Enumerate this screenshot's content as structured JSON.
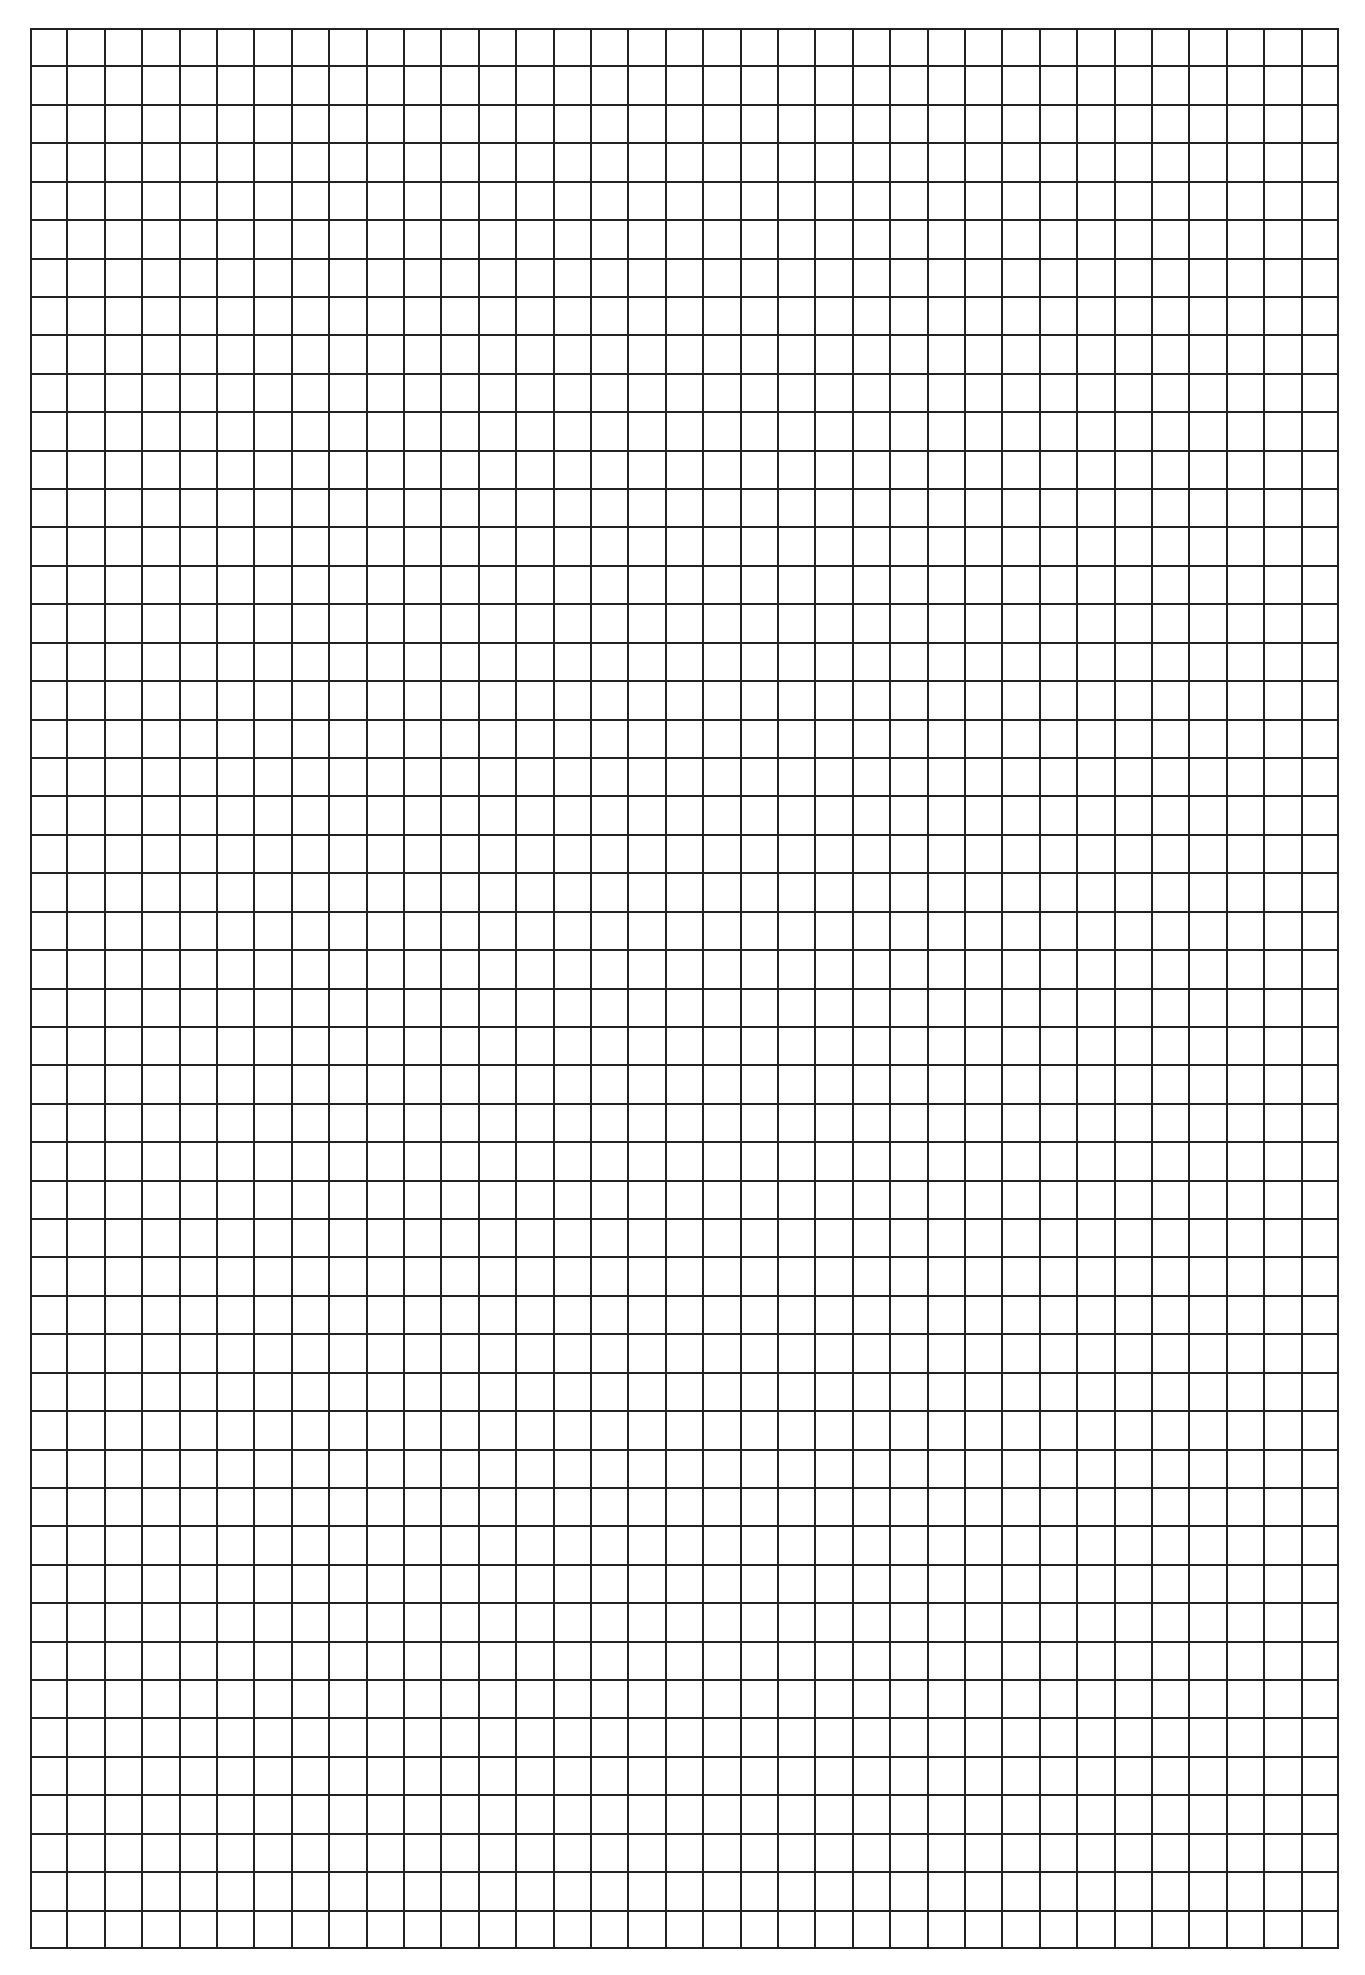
{
  "sheet": {
    "type": "graph-paper",
    "columns": 35,
    "rows": 50,
    "line_color": "#222222",
    "background_color": "#ffffff",
    "line_width_px": 2
  }
}
